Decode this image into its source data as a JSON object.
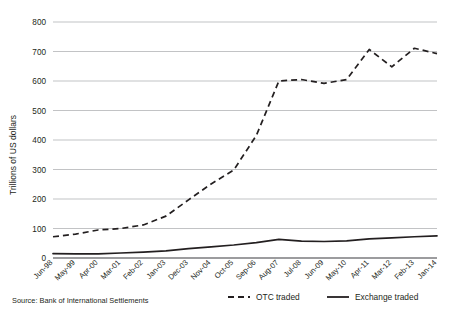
{
  "chart_data": {
    "type": "line",
    "title": "",
    "xlabel": "",
    "ylabel": "Trillions of US dollars",
    "ylim": [
      0,
      800
    ],
    "yticks": [
      0,
      100,
      200,
      300,
      400,
      500,
      600,
      700,
      800
    ],
    "grid": true,
    "legend_position": "bottom",
    "categories": [
      "Jun-98",
      "May-99",
      "Apr-00",
      "Mar-01",
      "Feb-02",
      "Jan-03",
      "Dec-03",
      "Nov-04",
      "Oct-05",
      "Sep-06",
      "Aug-07",
      "Jul-08",
      "Jun-09",
      "May-10",
      "Apr-11",
      "Mar-12",
      "Feb-13",
      "Jan-14"
    ],
    "series": [
      {
        "name": "OTC traded",
        "style": "dashed",
        "color": "#231f20",
        "values": [
          72,
          81,
          95,
          100,
          112,
          142,
          197,
          251,
          298,
          415,
          600,
          605,
          592,
          605,
          707,
          648,
          711,
          693
        ]
      },
      {
        "name": "Exchange traded",
        "style": "solid",
        "color": "#231f20",
        "values": [
          15,
          14,
          14,
          17,
          20,
          24,
          32,
          38,
          44,
          52,
          63,
          57,
          56,
          58,
          65,
          68,
          72,
          75
        ]
      }
    ],
    "source": "Source: Bank of International Settlements"
  },
  "legend": {
    "items": [
      {
        "label": "OTC traded",
        "style": "dashed"
      },
      {
        "label": "Exchange traded",
        "style": "solid"
      }
    ]
  },
  "colors": {
    "line": "#231f20",
    "grid": "#a7a9ac",
    "axis": "#58595b",
    "background": "#ffffff"
  }
}
